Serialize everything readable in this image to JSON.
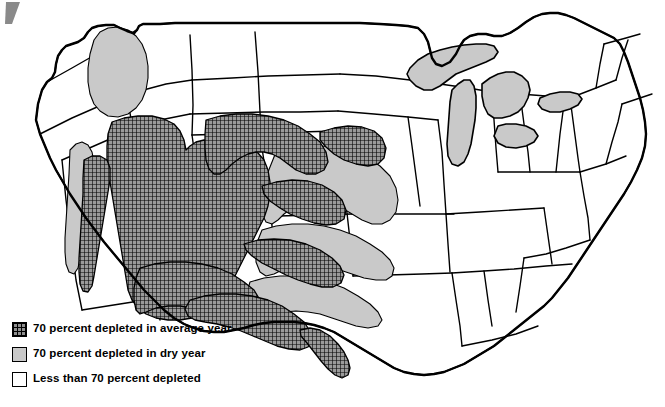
{
  "figure": {
    "type": "thematic-choropleth-map",
    "region": "Contiguous United States",
    "background_color": "#ffffff",
    "outline_color": "#000000"
  },
  "legend": {
    "items": [
      {
        "id": "average-year",
        "swatch": "crosshatch-grid-swatch",
        "pattern": "crosshatch",
        "color": "#8f8f8f",
        "label": "70 percent depleted in average year"
      },
      {
        "id": "dry-year",
        "swatch": "solid-gray-swatch",
        "pattern": "solid",
        "color": "#c9c9c9",
        "label": "70 percent depleted in dry year"
      },
      {
        "id": "less-than-70",
        "swatch": "empty-white-swatch",
        "pattern": "none",
        "color": "#ffffff",
        "label": "Less than 70 percent depleted"
      }
    ]
  },
  "map_features": {
    "lakes": [
      "Lake Superior",
      "Lake Michigan",
      "Lake Huron",
      "Lake Erie",
      "Lake Ontario"
    ],
    "average_year_regions": [
      "Central Valley California",
      "Great Basin Nevada",
      "Southern Arizona",
      "Western New Mexico",
      "High Plains Nebraska",
      "Western Kansas",
      "Texas Panhandle",
      "Central Texas",
      "Lower Rio Grande"
    ],
    "dry_year_regions": [
      "Snake River Plain Idaho",
      "Coastal California",
      "Central Kansas",
      "Oklahoma",
      "Eastern Texas"
    ],
    "undepleted_label": "Less than 70 percent depleted"
  }
}
